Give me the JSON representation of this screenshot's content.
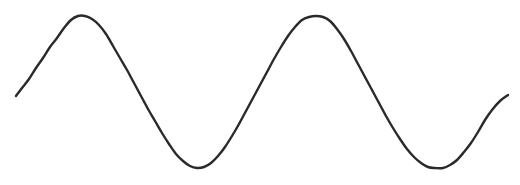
{
  "figure": {
    "name": "sine-wave-plot",
    "width": 520,
    "height": 185,
    "background_color": "#ffffff",
    "axes_visible": false,
    "gridlines_visible": false,
    "title": "",
    "labels_visible": false
  },
  "style": {
    "line_color": "#2a2a2a",
    "line_width": 2.4,
    "line_cap": "round",
    "line_join": "round"
  },
  "chart_data": {
    "type": "line",
    "title": "",
    "subtitle": "",
    "xlabel": "",
    "ylabel": "",
    "grid": false,
    "legend_position": "none",
    "axis_visible": false,
    "tick_labels_x": [],
    "tick_labels_y": [],
    "xlim": [
      16,
      508
    ],
    "ylim": [
      16,
      168
    ],
    "waveform": {
      "shape": "sine",
      "cycles": 1.7,
      "amplitude_px": 76,
      "period_px": 240,
      "baseline_y_px": 92,
      "peak_y_px": 16,
      "trough_y_px": 168,
      "start_point": [
        16,
        96
      ],
      "end_point": [
        508,
        95
      ],
      "extrema": [
        {
          "kind": "peak",
          "x": 78,
          "y": 16
        },
        {
          "kind": "trough",
          "x": 197,
          "y": 168
        },
        {
          "kind": "peak",
          "x": 318,
          "y": 16
        },
        {
          "kind": "trough",
          "x": 443,
          "y": 168
        }
      ],
      "midline_crossings": [
        {
          "x": 138,
          "y": 92,
          "direction": "falling"
        },
        {
          "x": 258,
          "y": 92,
          "direction": "rising"
        },
        {
          "x": 382,
          "y": 92,
          "direction": "falling"
        }
      ]
    },
    "series": [
      {
        "name": "wave",
        "color": "#2a2a2a",
        "points": [
          [
            16,
            96
          ],
          [
            22,
            88
          ],
          [
            29,
            79
          ],
          [
            36,
            68
          ],
          [
            43,
            58
          ],
          [
            50,
            47
          ],
          [
            57,
            38
          ],
          [
            64,
            28
          ],
          [
            71,
            20
          ],
          [
            78,
            16
          ],
          [
            85,
            16
          ],
          [
            92,
            19
          ],
          [
            99,
            25
          ],
          [
            106,
            34
          ],
          [
            113,
            46
          ],
          [
            120,
            58
          ],
          [
            127,
            70
          ],
          [
            134,
            83
          ],
          [
            141,
            96
          ],
          [
            148,
            109
          ],
          [
            155,
            121
          ],
          [
            162,
            133
          ],
          [
            169,
            144
          ],
          [
            176,
            154
          ],
          [
            183,
            161
          ],
          [
            190,
            166
          ],
          [
            197,
            168
          ],
          [
            204,
            167
          ],
          [
            211,
            163
          ],
          [
            218,
            156
          ],
          [
            225,
            147
          ],
          [
            232,
            136
          ],
          [
            239,
            124
          ],
          [
            246,
            111
          ],
          [
            253,
            98
          ],
          [
            260,
            85
          ],
          [
            267,
            72
          ],
          [
            274,
            59
          ],
          [
            281,
            47
          ],
          [
            288,
            36
          ],
          [
            295,
            27
          ],
          [
            302,
            20
          ],
          [
            309,
            17
          ],
          [
            316,
            16
          ],
          [
            323,
            17
          ],
          [
            330,
            21
          ],
          [
            337,
            29
          ],
          [
            344,
            39
          ],
          [
            351,
            51
          ],
          [
            358,
            64
          ],
          [
            365,
            77
          ],
          [
            372,
            90
          ],
          [
            379,
            103
          ],
          [
            386,
            116
          ],
          [
            393,
            128
          ],
          [
            400,
            139
          ],
          [
            407,
            149
          ],
          [
            414,
            157
          ],
          [
            421,
            163
          ],
          [
            428,
            167
          ],
          [
            435,
            168
          ],
          [
            443,
            168
          ],
          [
            450,
            165
          ],
          [
            457,
            160
          ],
          [
            464,
            152
          ],
          [
            471,
            143
          ],
          [
            478,
            132
          ],
          [
            485,
            120
          ],
          [
            492,
            110
          ],
          [
            500,
            101
          ],
          [
            508,
            95
          ]
        ]
      }
    ]
  }
}
